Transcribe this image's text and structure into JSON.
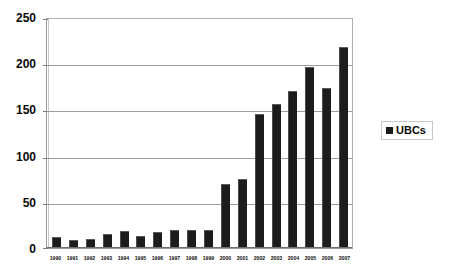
{
  "chart_data": {
    "type": "bar",
    "title": "",
    "xlabel": "",
    "ylabel": "",
    "categories": [
      "1990",
      "1991",
      "1992",
      "1993",
      "1994",
      "1995",
      "1996",
      "1997",
      "1998",
      "1999",
      "2000",
      "2001",
      "2002",
      "2003",
      "2004",
      "2005",
      "2006",
      "2007"
    ],
    "series": [
      {
        "name": "UBCs",
        "color": "#1c1c1c",
        "values": [
          11,
          8,
          9,
          14,
          17,
          12,
          16,
          19,
          19,
          18,
          68,
          74,
          145,
          155,
          170,
          196,
          173,
          217
        ]
      }
    ],
    "ylim": [
      0,
      250
    ],
    "yticks": [
      0,
      50,
      100,
      150,
      200,
      250
    ],
    "ytick_labels": [
      "0",
      "50",
      "100",
      "150",
      "200",
      "250"
    ],
    "grid": "horizontal",
    "legend_position": "right",
    "legend": [
      {
        "label": "UBCs",
        "marker": "square",
        "color": "#1a1a1a"
      }
    ]
  },
  "axes": {
    "y_tick_labels": [
      "250",
      "200",
      "150",
      "100",
      "50",
      "0"
    ],
    "x_tick_labels": [
      "1990",
      "1991",
      "1992",
      "1993",
      "1994",
      "1995",
      "1996",
      "1997",
      "1998",
      "1999",
      "2000",
      "2001",
      "2002",
      "2003",
      "2004",
      "2005",
      "2006",
      "2007"
    ]
  },
  "legend_box": {
    "label": "UBCs"
  },
  "colors": {
    "bar": "#1c1c1c",
    "grid": "#9c9c9c",
    "frame": "#9a9a9a",
    "text": "#0a0a0a",
    "background": "#ffffff"
  }
}
